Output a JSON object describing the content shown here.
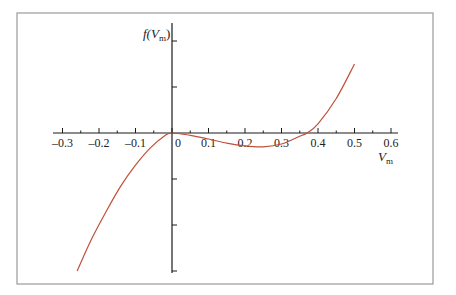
{
  "chart_data": {
    "type": "line",
    "title": "",
    "xlabel": "V_m",
    "ylabel": "f(V_m)",
    "xlabel_display": {
      "main": "V",
      "sub": "m"
    },
    "ylabel_display": {
      "prefix": "f(",
      "main": "V",
      "sub": "m",
      "suffix": ")"
    },
    "xlim": [
      -0.3,
      0.6
    ],
    "x_ticks": [
      "-0.3",
      "-0.2",
      "-0.1",
      "0",
      "0.1",
      "0.2",
      "0.3",
      "0.4",
      "0.5",
      "0.6"
    ],
    "y_tick_count_above": 2,
    "y_tick_count_below": 3,
    "y_tick_labels_shown": false,
    "grid": false,
    "legend": null,
    "series": [
      {
        "name": "f(V_m)",
        "color": "#c0503a",
        "x": [
          -0.26,
          -0.22,
          -0.18,
          -0.14,
          -0.1,
          -0.06,
          -0.02,
          0.0,
          0.05,
          0.1,
          0.15,
          0.2,
          0.25,
          0.3,
          0.35,
          0.37,
          0.4,
          0.45,
          0.5
        ],
        "y": [
          -3.0,
          -2.3,
          -1.7,
          -1.15,
          -0.7,
          -0.33,
          -0.06,
          0.0,
          -0.05,
          -0.13,
          -0.22,
          -0.28,
          -0.3,
          -0.24,
          -0.07,
          0.0,
          0.2,
          0.75,
          1.5
        ]
      }
    ]
  }
}
